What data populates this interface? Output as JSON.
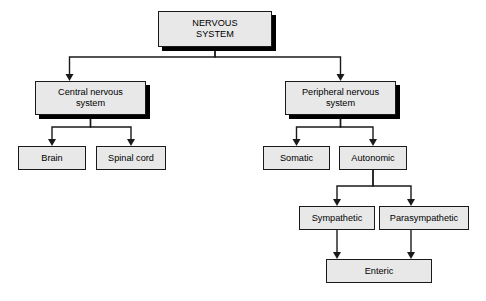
{
  "diagram": {
    "type": "hierarchy-flowchart",
    "background_color": "#ffffff",
    "node_fill_color": "#e8e8e8",
    "node_border_color": "#1a1a1a",
    "shadow_color": "#000000",
    "connector_color": "#1a1a1a"
  },
  "nodes": [
    {
      "id": "nervous-system",
      "label": "NERVOUS\nSYSTEM",
      "x": 158,
      "y": 11,
      "w": 114,
      "h": 36,
      "font_size": 9.2,
      "shadow": true,
      "level": 0
    },
    {
      "id": "central-nervous-system",
      "label": "Central nervous\nsystem",
      "x": 35,
      "y": 81,
      "w": 111,
      "h": 34,
      "font_size": 9.2,
      "shadow": true,
      "level": 1
    },
    {
      "id": "peripheral-nervous-system",
      "label": "Peripheral nervous\nsystem",
      "x": 285,
      "y": 81,
      "w": 111,
      "h": 34,
      "font_size": 9.2,
      "shadow": true,
      "level": 1
    },
    {
      "id": "brain",
      "label": "Brain",
      "x": 18,
      "y": 146,
      "w": 68,
      "h": 24,
      "font_size": 9.2,
      "shadow": false,
      "level": 2
    },
    {
      "id": "spinal-cord",
      "label": "Spinal cord",
      "x": 96,
      "y": 146,
      "w": 70,
      "h": 24,
      "font_size": 9.2,
      "shadow": false,
      "level": 2
    },
    {
      "id": "somatic",
      "label": "Somatic",
      "x": 263,
      "y": 146,
      "w": 67,
      "h": 24,
      "font_size": 9.2,
      "shadow": false,
      "level": 2
    },
    {
      "id": "autonomic",
      "label": "Autonomic",
      "x": 339,
      "y": 146,
      "w": 68,
      "h": 24,
      "font_size": 9.2,
      "shadow": false,
      "level": 2
    },
    {
      "id": "sympathetic",
      "label": "Sympathetic",
      "x": 299,
      "y": 206,
      "w": 76,
      "h": 24,
      "font_size": 9.2,
      "shadow": false,
      "level": 3
    },
    {
      "id": "parasympathetic",
      "label": "Parasympathetic",
      "x": 379,
      "y": 206,
      "w": 90,
      "h": 24,
      "font_size": 9.2,
      "shadow": false,
      "level": 3
    },
    {
      "id": "enteric",
      "label": "Enteric",
      "x": 326,
      "y": 259,
      "w": 106,
      "h": 24,
      "font_size": 9.2,
      "shadow": false,
      "level": 4
    }
  ],
  "edges": [
    {
      "id": "nervous-system-to-central",
      "from": "nervous-system",
      "to": "central-nervous-system",
      "style": "elbow",
      "arrow": true
    },
    {
      "id": "nervous-system-to-peripheral",
      "from": "nervous-system",
      "to": "peripheral-nervous-system",
      "style": "elbow",
      "arrow": true
    },
    {
      "id": "central-to-brain",
      "from": "central-nervous-system",
      "to": "brain",
      "style": "elbow",
      "arrow": true
    },
    {
      "id": "central-to-spinal-cord",
      "from": "central-nervous-system",
      "to": "spinal-cord",
      "style": "elbow",
      "arrow": true
    },
    {
      "id": "peripheral-to-somatic",
      "from": "peripheral-nervous-system",
      "to": "somatic",
      "style": "elbow",
      "arrow": true
    },
    {
      "id": "peripheral-to-autonomic",
      "from": "peripheral-nervous-system",
      "to": "autonomic",
      "style": "elbow",
      "arrow": true
    },
    {
      "id": "autonomic-to-sympathetic",
      "from": "autonomic",
      "to": "sympathetic",
      "style": "elbow",
      "arrow": true
    },
    {
      "id": "autonomic-to-parasympathetic",
      "from": "autonomic",
      "to": "parasympathetic",
      "style": "elbow",
      "arrow": true
    },
    {
      "id": "sympathetic-to-enteric",
      "from": "sympathetic",
      "to": "enteric",
      "style": "straight",
      "arrow": true
    },
    {
      "id": "parasympathetic-to-enteric",
      "from": "parasympathetic",
      "to": "enteric",
      "style": "straight",
      "arrow": true
    }
  ],
  "edge_paths": [
    {
      "id": "nervous-system-to-central",
      "d": "M 215 47 L 215 57 L 69.5 57 L 69.5 74",
      "tip": [
        69.5,
        81
      ]
    },
    {
      "id": "nervous-system-to-peripheral",
      "d": "M 215 47 L 215 57 L 340.5 57 L 340.5 74",
      "tip": [
        340.5,
        81
      ]
    },
    {
      "id": "central-to-brain",
      "d": "M 90.5 115 L 90.5 127 L 52 127 L 52 139",
      "tip": [
        52,
        146
      ]
    },
    {
      "id": "central-to-spinal-cord",
      "d": "M 90.5 115 L 90.5 127 L 131 127 L 131 139",
      "tip": [
        131,
        146
      ]
    },
    {
      "id": "peripheral-to-somatic",
      "d": "M 340.5 115 L 340.5 127 L 296.5 127 L 296.5 139",
      "tip": [
        296.5,
        146
      ]
    },
    {
      "id": "peripheral-to-autonomic",
      "d": "M 340.5 115 L 340.5 127 L 373 127 L 373 139",
      "tip": [
        373,
        146
      ]
    },
    {
      "id": "autonomic-to-sympathetic",
      "d": "M 373 170 L 373 186 L 337 186 L 337 199",
      "tip": [
        337,
        206
      ]
    },
    {
      "id": "autonomic-to-parasympathetic",
      "d": "M 373 170 L 373 186 L 411 186 L 411 199",
      "tip": [
        411,
        206
      ]
    },
    {
      "id": "sympathetic-to-enteric",
      "d": "M 337 230 L 337 252",
      "tip": [
        337,
        259
      ]
    },
    {
      "id": "parasympathetic-to-enteric",
      "d": "M 411 230 L 411 252",
      "tip": [
        411,
        259
      ]
    }
  ]
}
